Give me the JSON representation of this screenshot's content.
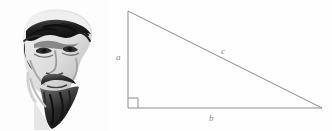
{
  "figure": {
    "name": "pythagorean-right-triangle-figure",
    "background_color": "#fefefe",
    "width": 332,
    "height": 131
  },
  "illustration": {
    "name": "bearded-philosopher-bust",
    "description": "Grayscale engraved bust portrait of a bearded man (Pythagoras)",
    "alt_text": "Bust of a bearded ancient Greek philosopher",
    "palette": {
      "darkest": "#1a1a1a",
      "dark": "#3d3d3d",
      "mid": "#777777",
      "light": "#c9c9c9",
      "highlight": "#ededed",
      "paper": "#fdfdfd"
    }
  },
  "triangle": {
    "name": "right-triangle",
    "stroke_color": "#8c8c8c",
    "stroke_width": 1,
    "vertices": {
      "apex": [
        18,
        11
      ],
      "right_angle": [
        18,
        108
      ],
      "base_end": [
        212,
        108
      ]
    },
    "right_angle_marker": {
      "name": "right-angle-square",
      "size": 10,
      "shown": true
    },
    "labels": {
      "leg_vertical": "a",
      "leg_horizontal": "b",
      "hypotenuse": "c"
    },
    "label_color": "#8a8a8a"
  }
}
